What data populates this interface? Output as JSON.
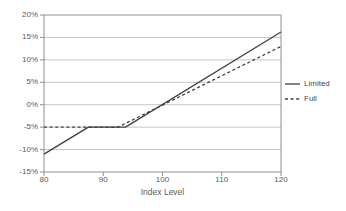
{
  "chart_data": {
    "type": "line",
    "title": "",
    "xlabel": "Index Level",
    "ylabel": "",
    "xlim": [
      80,
      120
    ],
    "ylim": [
      -15,
      20
    ],
    "x_ticks": [
      80,
      90,
      100,
      110,
      120
    ],
    "x_tick_labels": [
      "80",
      "90",
      "100",
      "110",
      "120"
    ],
    "y_ticks": [
      20,
      15,
      10,
      5,
      0,
      -5,
      -10,
      -15
    ],
    "y_tick_labels": [
      "20%",
      "15%",
      "10%",
      "5%",
      "0%",
      "-5%",
      "-10%",
      "-15%"
    ],
    "grid": "horizontal",
    "legend_position": "right",
    "colors": {
      "series_line": "#404040",
      "gridline": "#c6c6c6",
      "frame": "#8f8f8f",
      "text": "#595959"
    },
    "series": [
      {
        "name": "Limited",
        "style": "solid",
        "color": "#404040",
        "points": [
          [
            80,
            -11
          ],
          [
            87.5,
            -5
          ],
          [
            93.75,
            -5
          ],
          [
            120,
            16.2
          ]
        ]
      },
      {
        "name": "Full",
        "style": "dashed",
        "color": "#404040",
        "points": [
          [
            80,
            -5
          ],
          [
            92.5,
            -5
          ],
          [
            120,
            13
          ]
        ]
      }
    ]
  }
}
